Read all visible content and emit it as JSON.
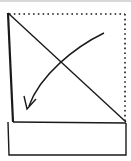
{
  "diagram": {
    "type": "origami-fold-step",
    "colors": {
      "stroke": "#1a1a1a",
      "background": "#ffffff"
    },
    "elements": {
      "dotted_edges": "original paper outline (top and right edges)",
      "diagonal": "fold line from top-left to right",
      "arrow": "fold direction, curving from upper-right to lower-left",
      "lower_strip": "rectangular strip below the triangle"
    }
  }
}
